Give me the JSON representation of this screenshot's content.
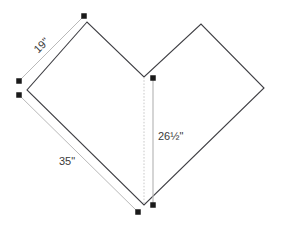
{
  "figure": {
    "title": "",
    "shape_name": "chevron-heart-polygon",
    "background_color": "#ffffff",
    "outline_color": "#3f3f44",
    "dimension_line_color": "#b9b9b9",
    "dotted_line_color": "#c9c9c9",
    "marker_color": "#1a1a1a",
    "label_color": "#3a3a3a",
    "outline_points": "87,22 27,90 144,205 264,88 201,24 144,77",
    "dotted_axis": {
      "name": "center-dotted-line",
      "x1": 144,
      "y1": 77,
      "x2": 144,
      "y2": 205
    },
    "dimension_lines": [
      {
        "name": "dimension-line-19",
        "x1": 19,
        "y1": 81,
        "x2": 84,
        "y2": 16
      },
      {
        "name": "dimension-line-35",
        "x1": 19,
        "y1": 95,
        "x2": 138,
        "y2": 212
      },
      {
        "name": "dimension-line-26-5",
        "x1": 153,
        "y1": 78,
        "x2": 153,
        "y2": 205
      }
    ],
    "markers": [
      {
        "name": "marker-top-left",
        "cx": 84,
        "cy": 16
      },
      {
        "name": "marker-left-upper",
        "cx": 19,
        "cy": 81
      },
      {
        "name": "marker-left-lower",
        "cx": 19,
        "cy": 95
      },
      {
        "name": "marker-bottom-left",
        "cx": 138,
        "cy": 212
      },
      {
        "name": "marker-bottom-right",
        "cx": 153,
        "cy": 205
      },
      {
        "name": "marker-notch",
        "cx": 153,
        "cy": 78
      }
    ],
    "labels": [
      {
        "name": "dimension-label-19",
        "text": "19\"",
        "x": 44,
        "y": 48,
        "rotation": -45
      },
      {
        "name": "dimension-label-35",
        "text": "35\"",
        "x": 67,
        "y": 165,
        "rotation": 0
      },
      {
        "name": "dimension-label-26-5",
        "text": "26½\"",
        "x": 158,
        "y": 140,
        "rotation": 0
      }
    ]
  },
  "chart_data": {
    "type": "diagram",
    "title": "",
    "measurements": [
      {
        "label": "19\"",
        "value": 19,
        "unit": "inches",
        "edge": "upper-left-slant"
      },
      {
        "label": "35\"",
        "value": 35,
        "unit": "inches",
        "edge": "lower-left-slant"
      },
      {
        "label": "26½\"",
        "value": 26.5,
        "unit": "inches",
        "edge": "center-vertical-height"
      }
    ]
  }
}
